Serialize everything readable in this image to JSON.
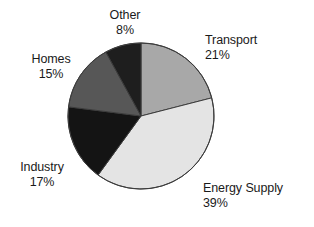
{
  "chart_data": {
    "type": "pie",
    "title": "",
    "subtitle": "",
    "xlabel": "",
    "ylabel": "",
    "legend_position": "none",
    "grid": false,
    "labels_on_slices": false,
    "label_format": "name + percent",
    "start_angle_deg": 0,
    "direction": "clockwise",
    "categories": [
      "Transport",
      "Energy Supply",
      "Industry",
      "Homes",
      "Other"
    ],
    "values": [
      21,
      39,
      17,
      15,
      8
    ],
    "units": "%",
    "slices": [
      {
        "name": "Transport",
        "percent": 21,
        "percent_text": "21%",
        "color": "#a8a8a8",
        "start_deg": 0,
        "end_deg": 75.6,
        "label_position": "right-top"
      },
      {
        "name": "Energy Supply",
        "percent": 39,
        "percent_text": "39%",
        "color": "#e4e4e4",
        "start_deg": 75.6,
        "end_deg": 216.0,
        "label_position": "bottom-right"
      },
      {
        "name": "Industry",
        "percent": 17,
        "percent_text": "17%",
        "color": "#141414",
        "start_deg": 216.0,
        "end_deg": 277.2,
        "label_position": "left-bottom"
      },
      {
        "name": "Homes",
        "percent": 15,
        "percent_text": "15%",
        "color": "#575757",
        "start_deg": 277.2,
        "end_deg": 331.2,
        "label_position": "left-top"
      },
      {
        "name": "Other",
        "percent": 8,
        "percent_text": "8%",
        "color": "#1e1e1e",
        "start_deg": 331.2,
        "end_deg": 360.0,
        "label_position": "top"
      }
    ],
    "geometry": {
      "center_x": 141,
      "center_y": 116,
      "radius": 73
    },
    "colors": {
      "background": "#ffffff",
      "outline": "#3c3c3c",
      "text": "#1a1a1a"
    }
  }
}
